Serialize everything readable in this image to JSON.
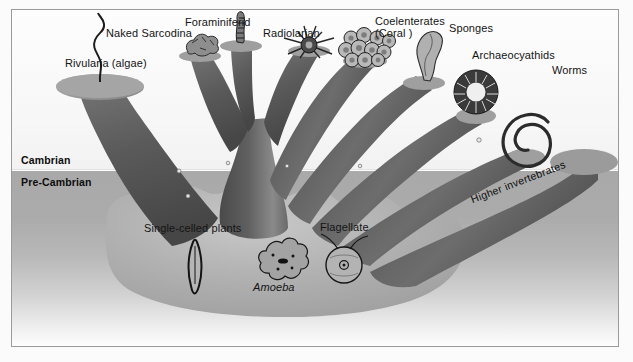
{
  "figure": {
    "kind": "evolutionary-tree-diagram",
    "palette": {
      "paper": "#ffffff",
      "frame_border": "#9a9a9a",
      "cambrian_band": "#f7f7f7",
      "precambrian_band": "#ababab",
      "trunk_dark": "#5b5b5b",
      "trunk_shadow": "#3f3f3f",
      "trunk_light": "#8f8f8f",
      "cap_top": "#9d9d9d",
      "text": "#141414"
    }
  },
  "eras": [
    {
      "id": "cambrian",
      "label": "Cambrian"
    },
    {
      "id": "pre-cambrian",
      "label": "Pre-Cambrian"
    }
  ],
  "branch_labels": [
    {
      "id": "rivularia",
      "label": "Rivularia (algae)"
    },
    {
      "id": "naked-sarcodina",
      "label": "Naked Sarcodina"
    },
    {
      "id": "foraminiferid",
      "label": "Foraminiferid"
    },
    {
      "id": "radiolarian",
      "label": "Radiolarian"
    },
    {
      "id": "coelenterates",
      "label": "Coelenterates"
    },
    {
      "id": "coelenterates-2",
      "label": "(Coral )"
    },
    {
      "id": "sponges",
      "label": "Sponges"
    },
    {
      "id": "archaeocyathids",
      "label": "Archaeocyathids"
    },
    {
      "id": "worms",
      "label": "Worms"
    },
    {
      "id": "higher-invertebrates",
      "label": "Higher invertebrates"
    }
  ],
  "base_labels": [
    {
      "id": "single-celled-plants",
      "label": "Single-celled plants",
      "italic": false
    },
    {
      "id": "amoeba",
      "label": "Amoeba",
      "italic": true
    },
    {
      "id": "flagellate",
      "label": "Flagellate",
      "italic": false
    }
  ],
  "organisms": [
    {
      "id": "rivularia-organism",
      "name": "rivularia-filament-icon"
    },
    {
      "id": "naked-sarcodina-organism",
      "name": "naked-sarcodina-icon"
    },
    {
      "id": "foraminiferid-organism",
      "name": "foraminiferid-test-icon"
    },
    {
      "id": "radiolarian-organism",
      "name": "radiolarian-spiny-icon"
    },
    {
      "id": "coral-organism",
      "name": "coral-colony-icon"
    },
    {
      "id": "sponge-organism",
      "name": "sponge-icon"
    },
    {
      "id": "archaeocyathid-organism",
      "name": "archaeocyathid-ring-icon"
    },
    {
      "id": "worm-organism",
      "name": "worm-spiral-icon"
    },
    {
      "id": "single-celled-plant-organism",
      "name": "diatom-spindle-icon"
    },
    {
      "id": "amoeba-organism",
      "name": "amoeba-icon"
    },
    {
      "id": "flagellate-organism",
      "name": "flagellate-icon"
    }
  ]
}
